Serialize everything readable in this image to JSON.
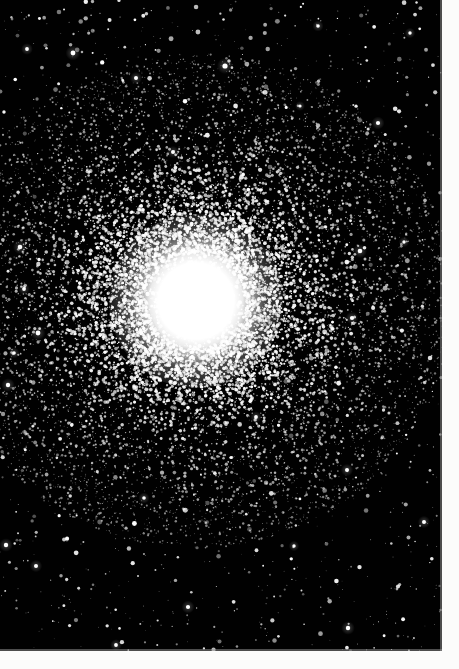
{
  "image": {
    "kind": "astronomical-photograph",
    "subject": "globular-star-cluster",
    "caption": "",
    "width": 459,
    "height": 669
  },
  "plate": {
    "label": "photographic-plate",
    "x": 0,
    "y": 0,
    "width": 442,
    "height": 651,
    "background_color": "#010101",
    "star_color": "#ffffff"
  },
  "margins": {
    "right_width": 17,
    "bottom_height": 18,
    "paper_color": "#fcfcfb",
    "seam_color": "#8e8e8e"
  },
  "cluster": {
    "name": "globular-cluster",
    "center_x": 196,
    "center_y": 301,
    "saturated_core_radius": 56,
    "resolved_halo_radius": 172,
    "outer_halo_radius": 250,
    "core_color": "#ffffff",
    "halo_color": "#f2f2f2"
  },
  "starfield": {
    "seed": 20240917,
    "field_star_count": 1500,
    "halo_star_count": 9000,
    "core_star_count": 4200,
    "min_star_radius": 0.4,
    "max_star_radius": 2.6,
    "bright_field_stars": [
      {
        "x": 27,
        "y": 49,
        "r": 1.9
      },
      {
        "x": 73,
        "y": 53,
        "r": 2.4
      },
      {
        "x": 225,
        "y": 66,
        "r": 2.6
      },
      {
        "x": 136,
        "y": 78,
        "r": 2.0
      },
      {
        "x": 318,
        "y": 26,
        "r": 1.8
      },
      {
        "x": 410,
        "y": 33,
        "r": 1.7
      },
      {
        "x": 378,
        "y": 123,
        "r": 2.1
      },
      {
        "x": 300,
        "y": 106,
        "r": 1.6
      },
      {
        "x": 24,
        "y": 289,
        "r": 1.9
      },
      {
        "x": 20,
        "y": 247,
        "r": 2.3
      },
      {
        "x": 14,
        "y": 353,
        "r": 1.8
      },
      {
        "x": 38,
        "y": 333,
        "r": 2.4
      },
      {
        "x": 8,
        "y": 385,
        "r": 2.2
      },
      {
        "x": 352,
        "y": 318,
        "r": 2.1
      },
      {
        "x": 360,
        "y": 251,
        "r": 2.3
      },
      {
        "x": 404,
        "y": 242,
        "r": 1.7
      },
      {
        "x": 347,
        "y": 470,
        "r": 2.0
      },
      {
        "x": 188,
        "y": 607,
        "r": 2.1
      },
      {
        "x": 116,
        "y": 645,
        "r": 1.9
      },
      {
        "x": 348,
        "y": 628,
        "r": 2.2
      },
      {
        "x": 294,
        "y": 546,
        "r": 1.7
      },
      {
        "x": 36,
        "y": 566,
        "r": 2.0
      },
      {
        "x": 6,
        "y": 545,
        "r": 2.2
      },
      {
        "x": 144,
        "y": 498,
        "r": 1.8
      },
      {
        "x": 424,
        "y": 522,
        "r": 2.0
      },
      {
        "x": 256,
        "y": 417,
        "r": 1.9
      },
      {
        "x": 173,
        "y": 152,
        "r": 2.0
      }
    ]
  },
  "chart_data": {
    "type": "scatter",
    "title": "",
    "xlabel": "",
    "ylabel": "",
    "radial_profile": {
      "radius_px": [
        0,
        25,
        50,
        56,
        75,
        100,
        125,
        150,
        175,
        200,
        230,
        260
      ],
      "relative_density": [
        1.0,
        1.0,
        1.0,
        0.96,
        0.72,
        0.45,
        0.27,
        0.15,
        0.08,
        0.04,
        0.02,
        0.01
      ]
    },
    "grid": false,
    "legend": "none"
  }
}
